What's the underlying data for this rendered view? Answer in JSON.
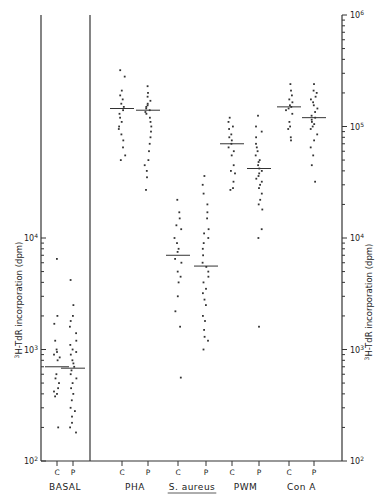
{
  "chart_data": {
    "type": "scatter",
    "title": "",
    "ylabel_left": "3H-TdR incorporation (dpm)",
    "ylabel_right": "3H-TdR incorporation (dpm)",
    "yscale": "log",
    "ylim": [
      100,
      1000000
    ],
    "yticks_left": [
      "10^2",
      "10^3",
      "10^4"
    ],
    "yticks_right": [
      "10^2",
      "10^3",
      "10^4",
      "10^5",
      "10^6"
    ],
    "groups": [
      {
        "label": "BASAL",
        "underline": false,
        "subgroups": [
          {
            "label": "C",
            "median": 700,
            "values": [
              6500,
              2000,
              1700,
              1200,
              1000,
              950,
              900,
              850,
              800,
              600,
              550,
              500,
              450,
              420,
              400,
              380,
              200
            ]
          },
          {
            "label": "P",
            "median": 680,
            "values": [
              4200,
              2500,
              2000,
              1800,
              1600,
              1400,
              1200,
              1100,
              1000,
              950,
              900,
              800,
              750,
              700,
              650,
              600,
              550,
              500,
              450,
              400,
              350,
              300,
              280,
              250,
              220,
              200,
              180
            ]
          }
        ]
      },
      {
        "label": "PHA",
        "underline": false,
        "subgroups": [
          {
            "label": "C",
            "median": 145000,
            "values": [
              320000,
              280000,
              210000,
              190000,
              175000,
              160000,
              150000,
              140000,
              130000,
              120000,
              110000,
              100000,
              95000,
              85000,
              75000,
              65000,
              55000,
              50000
            ]
          },
          {
            "label": "P",
            "median": 140000,
            "values": [
              230000,
              200000,
              185000,
              170000,
              160000,
              155000,
              150000,
              145000,
              140000,
              135000,
              130000,
              120000,
              110000,
              100000,
              90000,
              80000,
              70000,
              60000,
              50000,
              45000,
              40000,
              35000,
              27000
            ]
          }
        ]
      },
      {
        "label": "S. aureus",
        "underline": true,
        "subgroups": [
          {
            "label": "C",
            "median": 7000,
            "values": [
              22000,
              17000,
              15000,
              13000,
              12000,
              10000,
              9000,
              8000,
              7500,
              6500,
              6000,
              5000,
              4500,
              4000,
              3000,
              2200,
              1600,
              560
            ]
          },
          {
            "label": "P",
            "median": 5600,
            "values": [
              36000,
              30000,
              25000,
              20000,
              17000,
              15000,
              12000,
              11000,
              10000,
              9000,
              8000,
              7000,
              6000,
              5500,
              5000,
              4500,
              4000,
              3500,
              3200,
              2800,
              2500,
              2000,
              1800,
              1500,
              1300,
              1200,
              1000
            ]
          }
        ]
      },
      {
        "label": "PWM",
        "underline": false,
        "subgroups": [
          {
            "label": "C",
            "median": 70000,
            "values": [
              120000,
              110000,
              100000,
              95000,
              85000,
              80000,
              75000,
              70000,
              65000,
              60000,
              55000,
              45000,
              40000,
              38000,
              32000,
              28000,
              27000
            ]
          },
          {
            "label": "P",
            "median": 42000,
            "values": [
              125000,
              100000,
              90000,
              80000,
              70000,
              65000,
              60000,
              55000,
              50000,
              48000,
              45000,
              42000,
              40000,
              38000,
              36000,
              34000,
              32000,
              30000,
              28000,
              25000,
              22000,
              20000,
              18000,
              12000,
              10000,
              1600
            ]
          }
        ]
      },
      {
        "label": "Con A",
        "underline": false,
        "subgroups": [
          {
            "label": "C",
            "median": 150000,
            "values": [
              240000,
              210000,
              190000,
              175000,
              165000,
              155000,
              150000,
              145000,
              140000,
              130000,
              110000,
              100000,
              95000,
              80000,
              75000
            ]
          },
          {
            "label": "P",
            "median": 120000,
            "values": [
              240000,
              210000,
              200000,
              185000,
              175000,
              165000,
              155000,
              145000,
              135000,
              125000,
              120000,
              115000,
              110000,
              105000,
              100000,
              95000,
              85000,
              75000,
              65000,
              55000,
              45000,
              32000
            ]
          }
        ]
      }
    ],
    "legend": null,
    "grid": false
  }
}
